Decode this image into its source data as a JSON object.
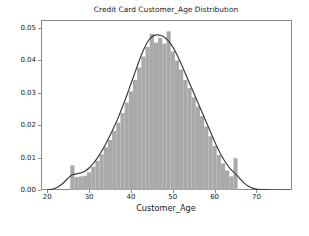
{
  "figure": {
    "background_color": "#ffffff",
    "width": 309,
    "height": 236
  },
  "chart_data": {
    "type": "bar",
    "subtype": "histogram-with-kde",
    "title": "Credit Card Customer_Age Distribution",
    "xlabel": "Customer_Age",
    "ylabel": "",
    "xlim": [
      18.5,
      78.5
    ],
    "ylim": [
      0.0,
      0.0525
    ],
    "grid": false,
    "legend": null,
    "bar_color": "#a9a9a9",
    "kde_color": "#3c3c3c",
    "axis_color": "#8a8a8a",
    "xticks": [
      20,
      30,
      40,
      50,
      60,
      70
    ],
    "xtick_labels": [
      "20",
      "30",
      "40",
      "50",
      "60",
      "70"
    ],
    "yticks": [
      0.0,
      0.01,
      0.02,
      0.03,
      0.04,
      0.05
    ],
    "ytick_labels": [
      "0.00",
      "0.01",
      "0.02",
      "0.03",
      "0.04",
      "0.05"
    ],
    "bin_width": 1,
    "categories": [
      26,
      27,
      28,
      29,
      30,
      31,
      32,
      33,
      34,
      35,
      36,
      37,
      38,
      39,
      40,
      41,
      42,
      43,
      44,
      45,
      46,
      47,
      48,
      49,
      50,
      51,
      52,
      53,
      54,
      55,
      56,
      57,
      58,
      59,
      60,
      61,
      62,
      63,
      64,
      65
    ],
    "values": [
      0.0076,
      0.004,
      0.0042,
      0.0044,
      0.0055,
      0.0072,
      0.009,
      0.011,
      0.0132,
      0.0155,
      0.0182,
      0.0208,
      0.0238,
      0.027,
      0.0305,
      0.034,
      0.0378,
      0.0412,
      0.0442,
      0.0482,
      0.0455,
      0.047,
      0.0452,
      0.049,
      0.0428,
      0.04,
      0.0372,
      0.034,
      0.0315,
      0.0286,
      0.0258,
      0.0228,
      0.0196,
      0.0166,
      0.0136,
      0.0108,
      0.0082,
      0.006,
      0.0042,
      0.0098
    ],
    "kde": {
      "x": [
        20.0,
        21.0,
        22.0,
        23.0,
        24.0,
        25.0,
        26.0,
        27.0,
        28.0,
        29.0,
        30.0,
        31.0,
        32.0,
        33.0,
        34.0,
        35.0,
        36.0,
        37.0,
        38.0,
        39.0,
        40.0,
        41.0,
        42.0,
        43.0,
        44.0,
        45.0,
        46.0,
        47.0,
        48.0,
        49.0,
        50.0,
        51.0,
        52.0,
        53.0,
        54.0,
        55.0,
        56.0,
        57.0,
        58.0,
        59.0,
        60.0,
        61.0,
        62.0,
        63.0,
        64.0,
        65.0,
        66.0,
        67.0,
        68.0,
        69.0,
        70.0,
        72.0,
        74.0,
        76.0,
        78.0
      ],
      "y": [
        0.0,
        0.0002,
        0.0006,
        0.0013,
        0.0024,
        0.0037,
        0.0047,
        0.005,
        0.0053,
        0.0058,
        0.0068,
        0.0082,
        0.0099,
        0.012,
        0.0143,
        0.0168,
        0.0196,
        0.0225,
        0.0258,
        0.0292,
        0.0328,
        0.0364,
        0.04,
        0.0432,
        0.0458,
        0.0473,
        0.0479,
        0.0478,
        0.0472,
        0.046,
        0.0442,
        0.0418,
        0.039,
        0.036,
        0.033,
        0.03,
        0.027,
        0.024,
        0.021,
        0.018,
        0.015,
        0.0122,
        0.0098,
        0.0078,
        0.0062,
        0.005,
        0.0036,
        0.0022,
        0.0012,
        0.0006,
        0.0003,
        0.0001,
        0.0,
        0.0,
        0.0
      ]
    },
    "annotations": [
      "Spike bin at age 26 (~0.0076)",
      "Spike bin at age 65 (~0.0098)",
      "Peak density ~0.049 near ages 45-49"
    ]
  }
}
